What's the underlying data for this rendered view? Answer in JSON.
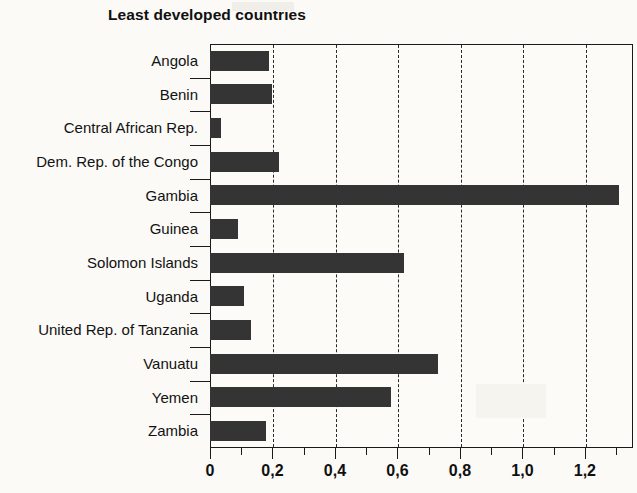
{
  "chart_data": {
    "type": "bar",
    "orientation": "horizontal",
    "title": "Least developed countries",
    "xlabel": "",
    "ylabel": "",
    "categories": [
      "Angola",
      "Benin",
      "Central African Rep.",
      "Dem. Rep. of the Congo",
      "Gambia",
      "Guinea",
      "Solomon Islands",
      "Uganda",
      "United Rep. of Tanzania",
      "Vanuatu",
      "Yemen",
      "Zambia"
    ],
    "values": [
      0.19,
      0.2,
      0.035,
      0.22,
      1.31,
      0.09,
      0.62,
      0.11,
      0.13,
      0.73,
      0.58,
      0.18
    ],
    "xlim": [
      0,
      1.354
    ],
    "xticks": [
      0,
      0.2,
      0.4,
      0.6,
      0.8,
      1.0,
      1.2
    ],
    "xtick_labels": [
      "0",
      "0,2",
      "0,4",
      "0,6",
      "0,8",
      "1,0",
      "1,2"
    ],
    "xminor_ticks": [
      0.1,
      0.3,
      0.5,
      0.7,
      0.9,
      1.1,
      1.3
    ],
    "grid": "vertical-dashed",
    "legend": null,
    "bar_color": "#343434",
    "axis_color": "#1a1a1a",
    "background_color": "#fbfaf7"
  }
}
